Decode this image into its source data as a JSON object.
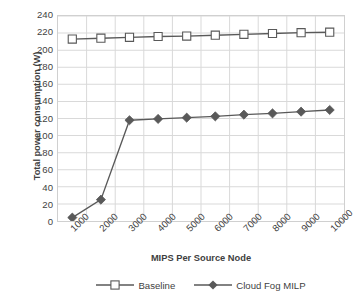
{
  "chart_data": {
    "type": "line",
    "title": "",
    "xlabel": "MIPS  Per Source Node",
    "ylabel": "Total power consumption (W)",
    "categories": [
      "1000",
      "2000",
      "3000",
      "4000",
      "5000",
      "6000",
      "7000",
      "8000",
      "9000",
      "10000"
    ],
    "ylim": [
      0,
      240
    ],
    "ytick_step": 20,
    "yticks": [
      "240",
      "220",
      "200",
      "180",
      "160",
      "140",
      "120",
      "100",
      "80",
      "60",
      "40",
      "20",
      "0"
    ],
    "grid": true,
    "legend_position": "bottom",
    "series": [
      {
        "name": "Baseline",
        "marker": "open-square",
        "color": "#595959",
        "values": [
          213,
          214,
          215,
          216,
          216.5,
          217.5,
          218.5,
          219.5,
          220.5,
          221
        ]
      },
      {
        "name": "Cloud Fog MILP",
        "marker": "filled-diamond",
        "color": "#595959",
        "values": [
          4,
          25,
          118,
          119.5,
          121,
          122.5,
          124.5,
          126,
          128,
          130
        ]
      }
    ]
  },
  "style": {
    "line_color": "#595959",
    "grid_color": "#d9d9d9",
    "border_color": "#d0d0d0",
    "text_color": "#3f3f3f",
    "background": "#ffffff"
  },
  "legend": {
    "items": [
      {
        "label": "Baseline"
      },
      {
        "label": "Cloud Fog MILP"
      }
    ]
  }
}
